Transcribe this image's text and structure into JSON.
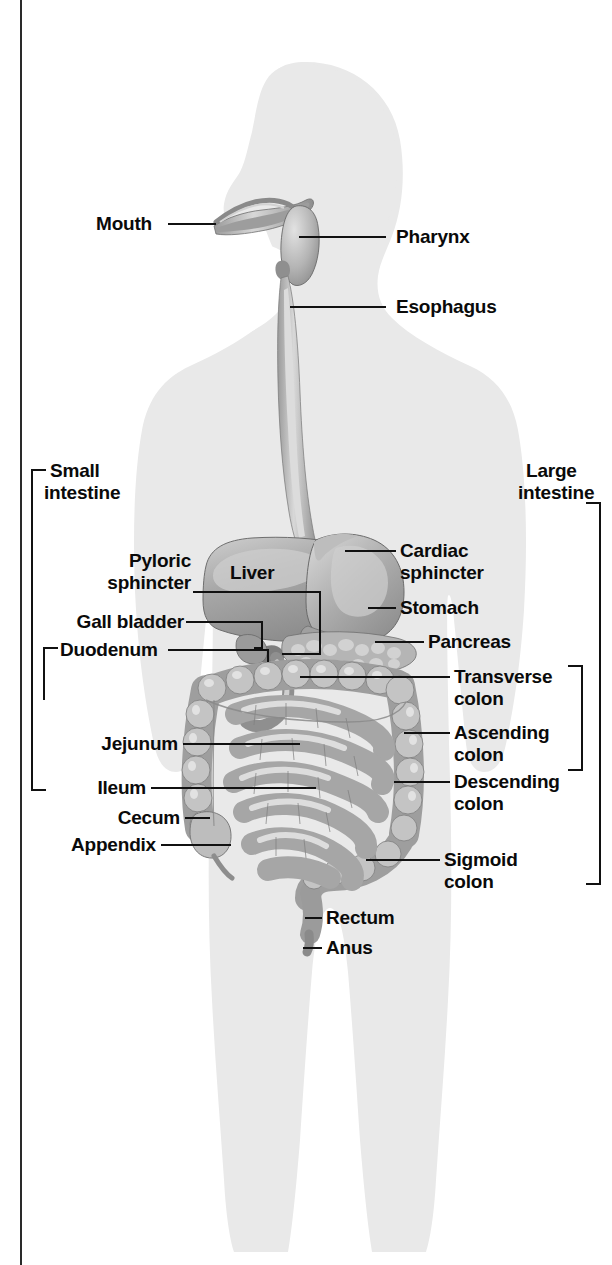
{
  "figure": {
    "silhouette_color": "#e9e9e9",
    "organ_color": "#b9b9b9",
    "line_color": "#111111",
    "text_color": "#0a0a0a"
  },
  "labels": {
    "mouth": "Mouth",
    "pharynx": "Pharynx",
    "esophagus": "Esophagus",
    "small_intestine_line1": "Small",
    "small_intestine_line2": "intestine",
    "large_intestine_line1": "Large",
    "large_intestine_line2": "intestine",
    "pyloric_line1": "Pyloric",
    "pyloric_line2": "sphincter",
    "liver": "Liver",
    "cardiac_line1": "Cardiac",
    "cardiac_line2": "sphincter",
    "stomach": "Stomach",
    "gall_bladder": "Gall bladder",
    "pancreas": "Pancreas",
    "duodenum": "Duodenum",
    "transverse_line1": "Transverse",
    "transverse_line2": "colon",
    "ascending_line1": "Ascending",
    "ascending_line2": "colon",
    "jejunum": "Jejunum",
    "descending_line1": "Descending",
    "descending_line2": "colon",
    "ileum": "Ileum",
    "cecum": "Cecum",
    "appendix": "Appendix",
    "sigmoid_line1": "Sigmoid",
    "sigmoid_line2": "colon",
    "rectum": "Rectum",
    "anus": "Anus"
  },
  "brackets": {
    "small_intestine": "bracket-small-intestine",
    "duodenum": "bracket-duodenum",
    "large_intestine": "bracket-large-intestine",
    "colon_group": "bracket-colon-group"
  }
}
